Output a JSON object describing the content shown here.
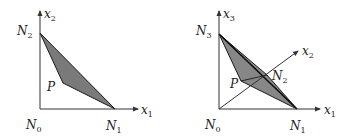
{
  "left_diagram": {
    "axis_x_label": "x",
    "axis_x_sub": "1",
    "axis_y_label": "x",
    "axis_y_sub": "2",
    "vertices": {
      "N0": {
        "label": "N",
        "sub": "0"
      },
      "N1": {
        "label": "N",
        "sub": "1"
      },
      "N2": {
        "label": "N",
        "sub": "2"
      },
      "P": {
        "label": "P"
      }
    }
  },
  "right_diagram": {
    "axis_x_label": "x",
    "axis_x_sub": "1",
    "axis_y_label": "x",
    "axis_y_sub": "2",
    "axis_z_label": "x",
    "axis_z_sub": "3",
    "vertices": {
      "N0": {
        "label": "N",
        "sub": "0"
      },
      "N1": {
        "label": "N",
        "sub": "1"
      },
      "N2": {
        "label": "N",
        "sub": "2"
      },
      "N3": {
        "label": "N",
        "sub": "3"
      },
      "P": {
        "label": "P"
      }
    }
  },
  "colors": {
    "fill": "#7a7a7a",
    "stroke": "#1a1a1a",
    "axis": "#333333"
  }
}
